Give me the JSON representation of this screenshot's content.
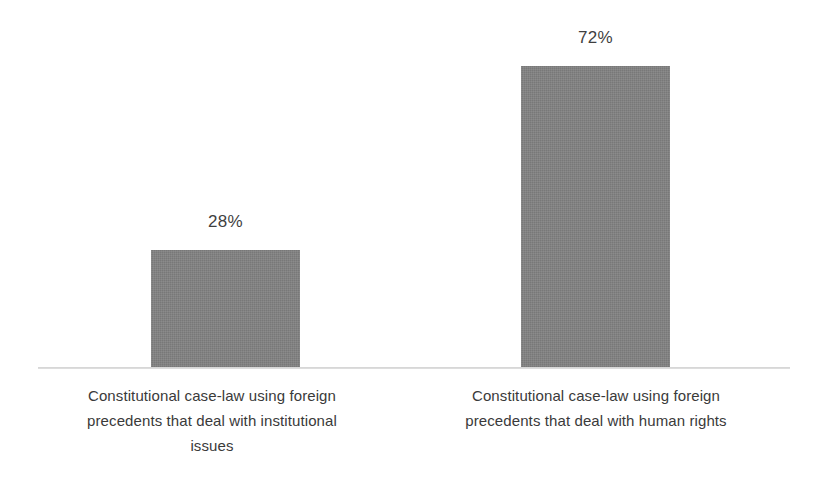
{
  "chart_data": {
    "type": "bar",
    "title": "",
    "subtitle": "",
    "xlabel": "",
    "ylabel": "",
    "categories": [
      "Constitutional case-law using foreign precedents that deal with institutional issues",
      "Constitutional case-law using foreign precedents that deal with human rights"
    ],
    "values": [
      28,
      72
    ],
    "value_labels": [
      "28%",
      "72%"
    ],
    "ylim": [
      0,
      100
    ],
    "grid": false,
    "legend": "none",
    "units": "percent",
    "orientation": "vertical",
    "series": [
      {
        "name": "",
        "values": [
          28,
          72
        ]
      }
    ]
  },
  "bars": [
    {
      "value_label": "28%",
      "category_lines": [
        "Constitutional case-law using foreign",
        "precedents that deal with institutional",
        "issues"
      ]
    },
    {
      "value_label": "72%",
      "category_lines": [
        "Constitutional case-law using foreign",
        "precedents that deal with human rights",
        ""
      ]
    }
  ],
  "colors": {
    "bar_fill": "#808080",
    "axis_line": "#d2d2d2",
    "value_text": "#3f3f3f",
    "category_text": "#3a3a3a",
    "background": "#ffffff"
  }
}
